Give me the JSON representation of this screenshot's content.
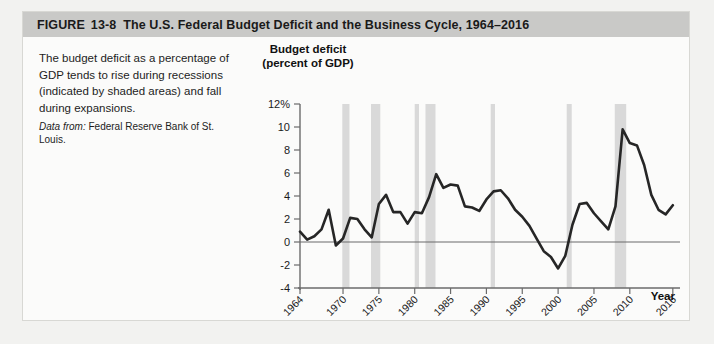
{
  "figure": {
    "label": "FIGURE",
    "number": "13-8",
    "title": "The U.S. Federal Budget Deficit and the Business Cycle, 1964–2016"
  },
  "caption": {
    "text": "The budget deficit as a percentage of GDP tends to rise during recessions (indicated by shaded areas) and fall during expansions.",
    "source_label": "Data from:",
    "source_text": "Federal Reserve Bank of St. Louis."
  },
  "colors": {
    "header_bar": "#c9c9c7",
    "card_background": "#fbfbfa",
    "page_background": "#f2f2f0",
    "line": "#262626",
    "recession_band": "#d9d9d9",
    "axis": "#6b6b6b",
    "zero_line": "#6b6b6b"
  },
  "chart_data": {
    "type": "line",
    "title": "Budget deficit (percent of GDP)",
    "ylabel": "Budget deficit (percent of GDP)",
    "xlabel": "Year",
    "ylim": [
      -4,
      12
    ],
    "xlim": [
      1964,
      2017
    ],
    "grid": false,
    "legend": "none",
    "ytick_labels": [
      "12%",
      "10",
      "8",
      "6",
      "4",
      "2",
      "0",
      "-2",
      "-4"
    ],
    "ytick_values": [
      12,
      10,
      8,
      6,
      4,
      2,
      0,
      -2,
      -4
    ],
    "xtick_labels": [
      "1964",
      "1970",
      "1975",
      "1980",
      "1985",
      "1990",
      "1995",
      "2000",
      "2005",
      "2010",
      "2016"
    ],
    "xtick_values": [
      1964,
      1970,
      1975,
      1980,
      1985,
      1990,
      1995,
      2000,
      2005,
      2010,
      2016
    ],
    "series": [
      {
        "name": "Federal budget deficit (percent of GDP)",
        "x": [
          1964,
          1965,
          1966,
          1967,
          1968,
          1969,
          1970,
          1971,
          1972,
          1973,
          1974,
          1975,
          1976,
          1977,
          1978,
          1979,
          1980,
          1981,
          1982,
          1983,
          1984,
          1985,
          1986,
          1987,
          1988,
          1989,
          1990,
          1991,
          1992,
          1993,
          1994,
          1995,
          1996,
          1997,
          1998,
          1999,
          2000,
          2001,
          2002,
          2003,
          2004,
          2005,
          2006,
          2007,
          2008,
          2009,
          2010,
          2011,
          2012,
          2013,
          2014,
          2015,
          2016
        ],
        "values": [
          0.9,
          0.2,
          0.5,
          1.1,
          2.8,
          -0.3,
          0.3,
          2.1,
          2.0,
          1.1,
          0.4,
          3.3,
          4.1,
          2.6,
          2.6,
          1.6,
          2.6,
          2.5,
          3.9,
          5.9,
          4.7,
          5.0,
          4.9,
          3.1,
          3.0,
          2.7,
          3.7,
          4.4,
          4.5,
          3.8,
          2.8,
          2.2,
          1.4,
          0.3,
          -0.8,
          -1.3,
          -2.3,
          -1.2,
          1.5,
          3.3,
          3.4,
          2.5,
          1.8,
          1.1,
          3.1,
          9.8,
          8.6,
          8.4,
          6.7,
          4.1,
          2.8,
          2.4,
          3.2
        ]
      }
    ],
    "recession_bands": [
      {
        "start": 1969.9,
        "end": 1970.9
      },
      {
        "start": 1973.9,
        "end": 1975.2
      },
      {
        "start": 1980.0,
        "end": 1980.6
      },
      {
        "start": 1981.5,
        "end": 1982.9
      },
      {
        "start": 1990.6,
        "end": 1991.2
      },
      {
        "start": 2001.2,
        "end": 2001.9
      },
      {
        "start": 2007.9,
        "end": 2009.5
      }
    ],
    "annotations": []
  }
}
